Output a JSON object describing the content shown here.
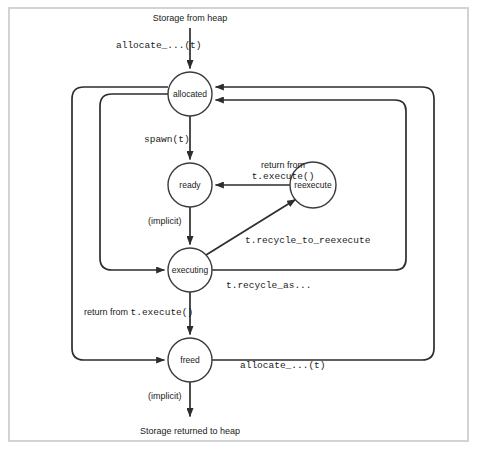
{
  "figure": {
    "frame_color": "#d2d3d5",
    "stroke_color": "#2d2d2d",
    "background": "#ffffff"
  },
  "terminals": {
    "source": "Storage from heap",
    "sink": "Storage returned to heap"
  },
  "nodes": [
    {
      "id": "allocated",
      "label": "allocated",
      "cx": 190,
      "cy": 94,
      "r": 22
    },
    {
      "id": "ready",
      "label": "ready",
      "cx": 190,
      "cy": 185,
      "r": 22
    },
    {
      "id": "reexecute",
      "label": "reexecute",
      "cx": 313,
      "cy": 185,
      "r": 23
    },
    {
      "id": "executing",
      "label": "executing",
      "cx": 190,
      "cy": 270,
      "r": 22
    },
    {
      "id": "freed",
      "label": "freed",
      "cx": 190,
      "cy": 360,
      "r": 22
    }
  ],
  "edges": [
    {
      "id": "heap-to-allocated",
      "from": "Storage from heap",
      "to": "allocated",
      "label": "allocate_...(t)",
      "label_style": "mono"
    },
    {
      "id": "allocated-to-ready",
      "from": "allocated",
      "to": "ready",
      "label": "spawn(t)",
      "label_style": "mono"
    },
    {
      "id": "ready-to-executing",
      "from": "ready",
      "to": "executing",
      "label": "(implicit)",
      "label_style": "sans"
    },
    {
      "id": "reexecute-to-ready",
      "from": "reexecute",
      "to": "ready",
      "label_line1": "return from",
      "label_line2": "t.execute()",
      "label_style": "mixed"
    },
    {
      "id": "executing-to-reexecute",
      "from": "executing",
      "to": "reexecute",
      "label": "t.recycle_to_reexecute",
      "label_style": "mono"
    },
    {
      "id": "executing-to-allocated",
      "from": "executing",
      "to": "allocated",
      "label": "t.recycle_as...",
      "label_style": "mono"
    },
    {
      "id": "executing-to-freed",
      "from": "executing",
      "to": "freed",
      "label_prefix": "return from ",
      "label_mono": "t.execute()",
      "label_style": "mixed"
    },
    {
      "id": "freed-to-allocated",
      "from": "freed",
      "to": "allocated",
      "label": "allocate_...(t)",
      "label_style": "mono"
    },
    {
      "id": "freed-to-heap",
      "from": "freed",
      "to": "Storage returned to heap",
      "label": "(implicit)",
      "label_style": "sans"
    }
  ]
}
